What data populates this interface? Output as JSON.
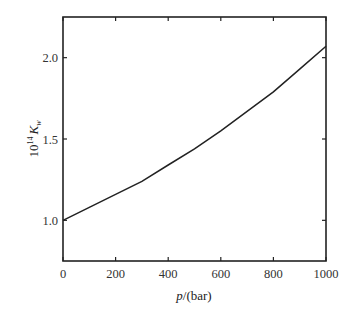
{
  "chart_data": {
    "type": "line",
    "title": "",
    "xlabel": "p/(bar)",
    "xlabel_italic": "p",
    "xlabel_rest": "/(bar)",
    "ylabel": "10^14 K_w",
    "ylabel_base": "10",
    "ylabel_exp": "14",
    "ylabel_var": "K",
    "ylabel_sub": "w",
    "xlim": [
      0,
      1000
    ],
    "ylim": [
      0.75,
      2.25
    ],
    "xticks": [
      0,
      200,
      400,
      600,
      800,
      1000
    ],
    "xtick_labels": [
      "0",
      "200",
      "400",
      "600",
      "800",
      "1000"
    ],
    "yticks": [
      1.0,
      1.5,
      2.0
    ],
    "ytick_labels": [
      "1.0",
      "1.5",
      "2.0"
    ],
    "grid": false,
    "legend": null,
    "series": [
      {
        "name": "K_w vs pressure",
        "x": [
          0,
          100,
          200,
          300,
          400,
          500,
          600,
          700,
          800,
          900,
          1000
        ],
        "y": [
          1.0,
          1.08,
          1.16,
          1.24,
          1.34,
          1.44,
          1.55,
          1.67,
          1.79,
          1.93,
          2.07
        ]
      }
    ],
    "colors": {
      "line": "#222222",
      "axes": "#222222"
    }
  }
}
